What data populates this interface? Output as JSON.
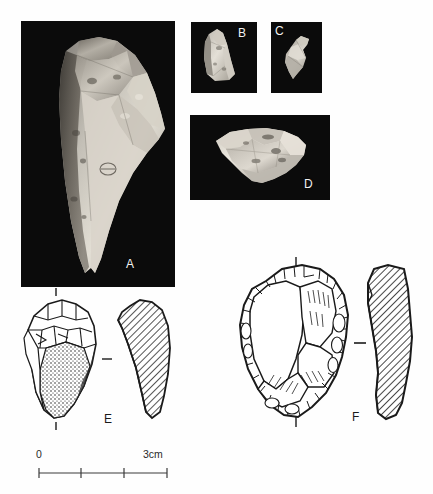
{
  "figure": {
    "type": "archaeological-lithic-plate",
    "background_color": "#ffffff",
    "photo_background_color": "#0b0b0b",
    "ink_color": "#1a1a1a",
    "label_color_on_photo": "#f2f2f2"
  },
  "panels": [
    {
      "id": "A",
      "label": "A",
      "kind": "photograph",
      "subject": "elongated pointed flint artefact, vertical orientation",
      "x": 21,
      "y": 21,
      "width": 154,
      "height": 266,
      "label_x": 126,
      "label_y": 257
    },
    {
      "id": "B",
      "label": "B",
      "kind": "photograph",
      "subject": "small angular flint flake",
      "x": 191,
      "y": 22,
      "width": 66,
      "height": 71,
      "label_x": 240,
      "label_y": 27
    },
    {
      "id": "C",
      "label": "C",
      "kind": "photograph",
      "subject": "small triangular flint fragment",
      "x": 271,
      "y": 22,
      "width": 51,
      "height": 71,
      "label_x": 275,
      "label_y": 25
    },
    {
      "id": "D",
      "label": "D",
      "kind": "photograph",
      "subject": "broad flat flint flake, horizontal orientation",
      "x": 190,
      "y": 115,
      "width": 140,
      "height": 85,
      "label_x": 305,
      "label_y": 178
    },
    {
      "id": "E",
      "label": "E",
      "kind": "line-drawing",
      "subject": "retouched flake with cortical surface, plan view plus cross-section",
      "label_x": 104,
      "label_y": 412
    },
    {
      "id": "F",
      "label": "F",
      "kind": "line-drawing",
      "subject": "Levallois core with radial flake scars, plan view plus cross-section",
      "label_x": 352,
      "label_y": 410
    }
  ],
  "scale_bar": {
    "start_label": "0",
    "end_label": "3cm",
    "unit": "cm",
    "min": 0,
    "max": 3,
    "divisions": 3,
    "tick_labels": [
      "0",
      "",
      "",
      "3cm"
    ]
  }
}
